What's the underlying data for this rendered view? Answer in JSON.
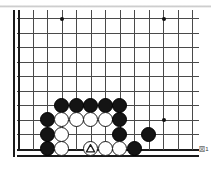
{
  "figure": {
    "kind": "go-board-diagram",
    "caption": "図1"
  },
  "colors": {
    "page_background": "#ffffff",
    "grid_line": "#4a4a4a",
    "edge_line": "#1a1a1a",
    "black_stone": "#141414",
    "white_stone": "#ffffff",
    "stone_outline": "#1b1b1b",
    "hoshi": "#111111",
    "caption_text": "#3b3b3b",
    "top_rule": "#c4c4c4"
  },
  "board": {
    "columns": 13,
    "rows": 10,
    "cell_size": 14.5,
    "origin_x": 10,
    "origin_y": 4,
    "stone_diameter": 15,
    "edges": {
      "left": true,
      "bottom": true,
      "top": false,
      "right": false
    },
    "hoshi": [
      {
        "col": 3,
        "row": 0
      },
      {
        "col": 10,
        "row": 0
      },
      {
        "col": 10,
        "row": 7
      }
    ],
    "stones": [
      {
        "col": 3,
        "row": 6,
        "color": "black",
        "marker": "none"
      },
      {
        "col": 4,
        "row": 6,
        "color": "black",
        "marker": "none"
      },
      {
        "col": 5,
        "row": 6,
        "color": "black",
        "marker": "none"
      },
      {
        "col": 6,
        "row": 6,
        "color": "black",
        "marker": "none"
      },
      {
        "col": 7,
        "row": 6,
        "color": "black",
        "marker": "none"
      },
      {
        "col": 2,
        "row": 7,
        "color": "black",
        "marker": "none"
      },
      {
        "col": 3,
        "row": 7,
        "color": "white",
        "marker": "none"
      },
      {
        "col": 4,
        "row": 7,
        "color": "white",
        "marker": "none"
      },
      {
        "col": 5,
        "row": 7,
        "color": "white",
        "marker": "none"
      },
      {
        "col": 6,
        "row": 7,
        "color": "white",
        "marker": "none"
      },
      {
        "col": 7,
        "row": 7,
        "color": "black",
        "marker": "none"
      },
      {
        "col": 2,
        "row": 8,
        "color": "black",
        "marker": "none"
      },
      {
        "col": 3,
        "row": 8,
        "color": "white",
        "marker": "none"
      },
      {
        "col": 7,
        "row": 8,
        "color": "black",
        "marker": "none"
      },
      {
        "col": 9,
        "row": 8,
        "color": "black",
        "marker": "none"
      },
      {
        "col": 2,
        "row": 9,
        "color": "black",
        "marker": "none"
      },
      {
        "col": 3,
        "row": 9,
        "color": "white",
        "marker": "none"
      },
      {
        "col": 5,
        "row": 9,
        "color": "white",
        "marker": "triangle"
      },
      {
        "col": 6,
        "row": 9,
        "color": "white",
        "marker": "none"
      },
      {
        "col": 7,
        "row": 9,
        "color": "white",
        "marker": "none"
      },
      {
        "col": 8,
        "row": 9,
        "color": "black",
        "marker": "none"
      }
    ]
  }
}
